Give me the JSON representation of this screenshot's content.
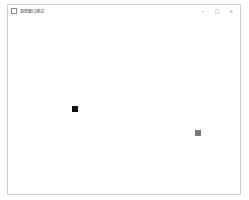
{
  "window": {
    "title": "游戏窗口测试",
    "controls": {
      "minimize": "–",
      "maximize": "□",
      "close": "×"
    }
  },
  "canvas": {
    "background": "#ffffff",
    "sprites": [
      {
        "name": "player-square",
        "x": 64,
        "y": 89,
        "size": 6,
        "color": "#111111"
      },
      {
        "name": "enemy-square",
        "x": 187,
        "y": 113,
        "size": 6,
        "color": "#7a7a7a"
      }
    ]
  }
}
